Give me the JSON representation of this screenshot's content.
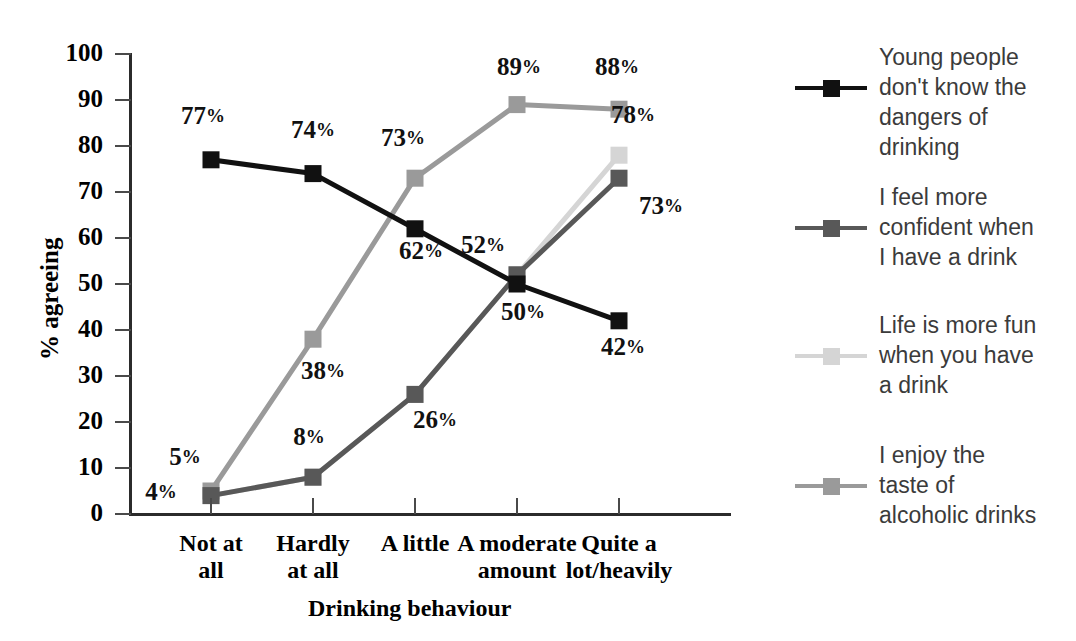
{
  "chart_data": {
    "type": "line",
    "title": "",
    "xlabel": "Drinking behaviour",
    "ylabel": "% agreeing",
    "ylim": [
      0,
      100
    ],
    "ytick_values": [
      0,
      10,
      20,
      30,
      40,
      50,
      60,
      70,
      80,
      90,
      100
    ],
    "ytick_labels": [
      "0",
      "10",
      "20",
      "30",
      "40",
      "50",
      "60",
      "70",
      "80",
      "90",
      "100"
    ],
    "grid": false,
    "legend_position": "right",
    "categories": [
      "Not at\nall",
      "Hardly\nat all",
      "A little",
      "A moderate\namount",
      "Quite a\nlot/heavily"
    ],
    "categories_flat": [
      "Not at all",
      "Hardly at all",
      "A little",
      "A moderate amount",
      "Quite a lot/heavily"
    ],
    "series": [
      {
        "name": "Young people don't know the dangers of drinking",
        "color": "#111111",
        "values": [
          77,
          74,
          62,
          50,
          42
        ],
        "point_labels": [
          "77%",
          "74%",
          "62%",
          "50%",
          "42%"
        ]
      },
      {
        "name": "I feel more confident when I have a drink",
        "color": "#585858",
        "values": [
          4,
          8,
          26,
          52,
          73
        ],
        "point_labels": [
          "4%",
          "8%",
          "26%",
          "52%",
          "73%"
        ]
      },
      {
        "name": "Life is more fun when you have a drink",
        "color": "#d5d5d5",
        "values": [
          4,
          8,
          26,
          52,
          78
        ],
        "point_labels": [
          "",
          "",
          "",
          "",
          "78%"
        ]
      },
      {
        "name": "I enjoy the taste of alcoholic drinks",
        "color": "#9a9a9a",
        "values": [
          5,
          38,
          73,
          89,
          88
        ],
        "point_labels": [
          "5%",
          "38%",
          "73%",
          "89%",
          "88%"
        ]
      }
    ],
    "annotations": [
      {
        "text": "77%",
        "value": 77,
        "series": 0,
        "category": 0
      },
      {
        "text": "74%",
        "value": 74,
        "series": 0,
        "category": 1
      },
      {
        "text": "62%",
        "value": 62,
        "series": 0,
        "category": 2
      },
      {
        "text": "50%",
        "value": 50,
        "series": 0,
        "category": 3
      },
      {
        "text": "42%",
        "value": 42,
        "series": 0,
        "category": 4
      },
      {
        "text": "4%",
        "value": 4,
        "series": 1,
        "category": 0
      },
      {
        "text": "8%",
        "value": 8,
        "series": 1,
        "category": 1
      },
      {
        "text": "26%",
        "value": 26,
        "series": 1,
        "category": 2
      },
      {
        "text": "52%",
        "value": 52,
        "series": 1,
        "category": 3
      },
      {
        "text": "73%",
        "value": 73,
        "series": 1,
        "category": 4
      },
      {
        "text": "78%",
        "value": 78,
        "series": 2,
        "category": 4
      },
      {
        "text": "5%",
        "value": 5,
        "series": 3,
        "category": 0
      },
      {
        "text": "38%",
        "value": 38,
        "series": 3,
        "category": 1
      },
      {
        "text": "73%",
        "value": 73,
        "series": 3,
        "category": 2
      },
      {
        "text": "89%",
        "value": 89,
        "series": 3,
        "category": 3
      },
      {
        "text": "88%",
        "value": 88,
        "series": 3,
        "category": 4
      }
    ]
  },
  "axes": {
    "ylabel": "% agreeing",
    "xlabel": "Drinking behaviour",
    "yticks": [
      "100",
      "90",
      "80",
      "70",
      "60",
      "50",
      "40",
      "30",
      "20",
      "10",
      "0"
    ],
    "xticks": [
      "Not at\nall",
      "Hardly\nat all",
      "A little",
      "A moderate\namount",
      "Quite a\nlot/heavily"
    ]
  },
  "legend": {
    "entries": [
      {
        "label": "Young people\ndon't know the\ndangers of\ndrinking",
        "color": "#111111"
      },
      {
        "label": "I feel more\nconfident when\nI have a drink",
        "color": "#585858"
      },
      {
        "label": "Life is more fun\nwhen you have\na drink",
        "color": "#d5d5d5"
      },
      {
        "label": "I enjoy the\ntaste of\nalcoholic drinks",
        "color": "#9a9a9a"
      }
    ]
  },
  "labels": {
    "p77": "77",
    "p74": "74",
    "p62": "62",
    "p50": "50",
    "p42": "42",
    "p4": "4",
    "p8": "8",
    "p26": "26",
    "p52": "52",
    "p73b": "73",
    "p78": "78",
    "p5": "5",
    "p38": "38",
    "p73c": "73",
    "p89": "89",
    "p88": "88",
    "pct": "%"
  }
}
